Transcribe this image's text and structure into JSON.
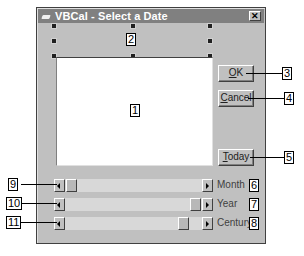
{
  "window": {
    "title": "VBCal - Select a Date",
    "close_glyph": "✕",
    "icon": "app-icon"
  },
  "controls": {
    "date_display_label": {
      "callout": "2"
    },
    "calendar_panel": {
      "callout": "1"
    },
    "ok_button": {
      "label_accel": "O",
      "label_rest": "K",
      "callout": "3"
    },
    "cancel_button": {
      "label_accel": "C",
      "label_rest": "ancel",
      "callout": "4"
    },
    "today_button": {
      "label_accel": "T",
      "label_rest": "oday",
      "callout": "5"
    }
  },
  "scrollbars": [
    {
      "name": "month",
      "label": "Month",
      "label_callout": "6",
      "bar_callout": "9",
      "thumb_position": 0.0
    },
    {
      "name": "year",
      "label": "Year",
      "label_callout": "7",
      "bar_callout": "10",
      "thumb_position": 0.94
    },
    {
      "name": "century",
      "label": "Century",
      "label_callout": "8",
      "bar_callout": "11",
      "thumb_position": 0.8
    }
  ],
  "colors": {
    "title_bar": "#808080",
    "form_background": "#c0c0c0",
    "panel": "#ffffff"
  }
}
